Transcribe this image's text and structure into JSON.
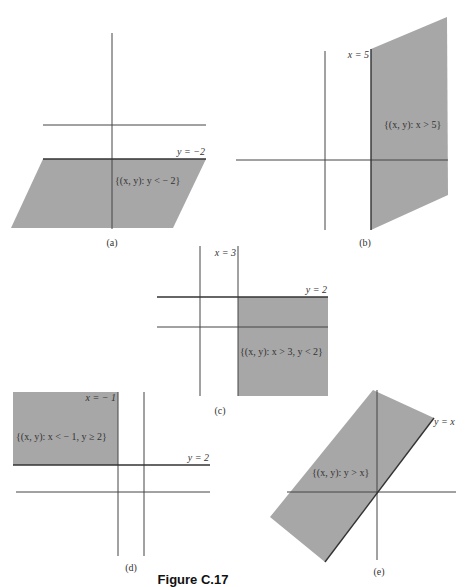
{
  "figure": {
    "title": "Figure C.17",
    "shade_color": "#a7a7a7",
    "line_color": "#444444"
  },
  "panels": {
    "a": {
      "caption": "(a)",
      "boundary_label": "y = −2",
      "region_label": "{(x, y): y < − 2}"
    },
    "b": {
      "caption": "(b)",
      "boundary_label": "x = 5",
      "region_label": "{(x, y): x > 5}"
    },
    "c": {
      "caption": "(c)",
      "boundary_x_label": "x = 3",
      "boundary_y_label": "y = 2",
      "region_label": "{(x, y): x > 3, y < 2}"
    },
    "d": {
      "caption": "(d)",
      "boundary_x_label": "x = − 1",
      "boundary_y_label": "y = 2",
      "region_label": "{(x, y): x < − 1, y ≥ 2}"
    },
    "e": {
      "caption": "(e)",
      "boundary_label": "y = x",
      "region_label": "{(x, y): y > x}"
    }
  }
}
